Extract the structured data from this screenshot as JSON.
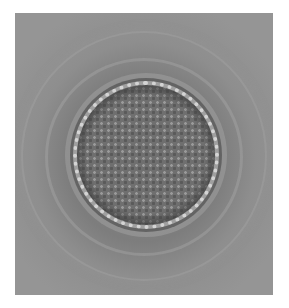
{
  "image": {
    "subject": "microscope photograph of a circular pollen grain with reticulate surface",
    "background_color": "#ffffff",
    "photo_tone": "#858585"
  }
}
